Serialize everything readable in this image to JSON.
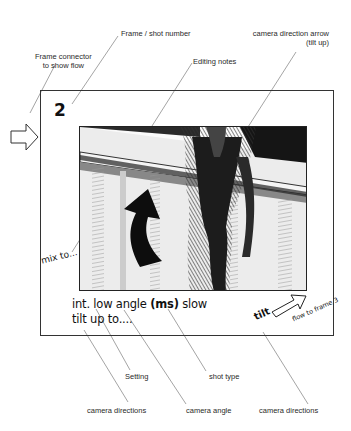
{
  "annotations": {
    "frame_shot_number": "Frame / shot number",
    "frame_connector_line1": "Frame connector",
    "frame_connector_line2": "to show flow",
    "editing_notes": "Editing notes",
    "camera_direction_arrow_line1": "camera direction arrow",
    "camera_direction_arrow_line2": "(tilt up)",
    "setting": "Setting",
    "shot_type": "shot type",
    "camera_directions_left": "camera directions",
    "camera_angle": "camera angle",
    "camera_directions_right": "camera directions"
  },
  "frame": {
    "shot_number": "2",
    "edit_note": "mix to...",
    "description": {
      "line1_part1": "int. low angle ",
      "line1_bold": "(ms)",
      "line1_part2": " slow",
      "line2": "tilt up to...."
    },
    "tilt_label": "tilt",
    "flow_label": "flow to frame 3"
  },
  "sketch": {
    "subject": "low-angle pencil sketch of a figure climbing, with a curved tilt-up arrow"
  }
}
